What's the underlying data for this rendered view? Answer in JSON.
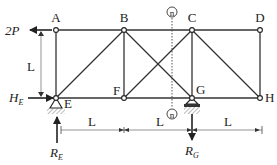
{
  "figure": {
    "type": "plane truss diagram",
    "joints": [
      {
        "id": "A",
        "label": "A"
      },
      {
        "id": "B",
        "label": "B"
      },
      {
        "id": "C",
        "label": "C"
      },
      {
        "id": "D",
        "label": "D"
      },
      {
        "id": "E",
        "label": "E"
      },
      {
        "id": "F",
        "label": "F"
      },
      {
        "id": "G",
        "label": "G"
      },
      {
        "id": "H",
        "label": "H"
      }
    ],
    "members": [
      "AB",
      "BC",
      "CD",
      "EF",
      "FG",
      "GH",
      "AE",
      "BF",
      "CG",
      "DH",
      "EB",
      "BG",
      "FC",
      "CH"
    ],
    "loads": {
      "applied_force": {
        "label_main": "2P",
        "direction": "left",
        "at": "A"
      }
    },
    "reactions": {
      "horizontal_E": {
        "label_main": "H",
        "label_sub": "E",
        "direction": "right"
      },
      "vertical_E": {
        "label_main": "R",
        "label_sub": "E",
        "direction": "up"
      },
      "vertical_G": {
        "label_main": "R",
        "label_sub": "G",
        "direction": "down"
      }
    },
    "supports": [
      {
        "at": "E",
        "kind": "pin"
      },
      {
        "at": "G",
        "kind": "pin"
      }
    ],
    "dimensions": {
      "height": "L",
      "spans": [
        "L",
        "L",
        "L"
      ]
    },
    "section": {
      "label_top": "n",
      "label_bottom": "n"
    },
    "colors": {
      "lines": "#333333",
      "dimension": "#666666",
      "hatch": "#888888"
    }
  }
}
